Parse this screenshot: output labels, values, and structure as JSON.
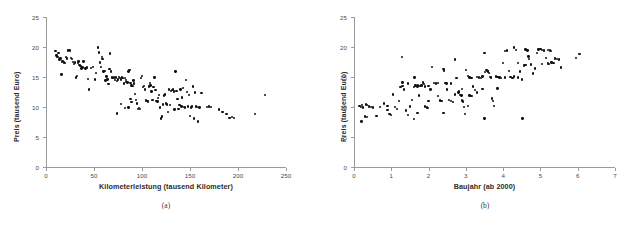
{
  "figure": {
    "background": "#ffffff",
    "point_color": "#111111",
    "axis_color": "#9a9a9a"
  },
  "panels": [
    {
      "caption": "(a)",
      "ylabel": "Preis (tausend Euro)",
      "xlabel": "Kilometerleistung (tausend Kilometer)",
      "xticks": [
        "0",
        "50",
        "100",
        "150",
        "200",
        "250"
      ],
      "yticks": [
        "0",
        "5",
        "10",
        "15",
        "20",
        "25"
      ]
    },
    {
      "caption": "(b)",
      "ylabel": "Preis (tausend Euro)",
      "xlabel": "Baujahr (ab 2000)",
      "xticks": [
        "0",
        "1",
        "2",
        "3",
        "4",
        "5",
        "6",
        "7"
      ],
      "yticks": [
        "0",
        "5",
        "10",
        "15",
        "20",
        "25"
      ]
    }
  ],
  "chart_data": [
    {
      "type": "scatter",
      "title": "",
      "subtitle": "(a)",
      "xlabel": "Kilometerleistung (tausend Kilometer)",
      "ylabel": "Preis (tausend Euro)",
      "xlim": [
        0,
        250
      ],
      "ylim": [
        0,
        25
      ],
      "xticks": [
        0,
        50,
        100,
        150,
        200,
        250
      ],
      "yticks": [
        0,
        5,
        10,
        15,
        20,
        25
      ],
      "grid": false,
      "legend": null,
      "n_points": 160,
      "points": [
        [
          10,
          19.3
        ],
        [
          11,
          18.6
        ],
        [
          12,
          18.3
        ],
        [
          13,
          19.0
        ],
        [
          14,
          17.9
        ],
        [
          15,
          18.1
        ],
        [
          16,
          15.4
        ],
        [
          17,
          17.6
        ],
        [
          18,
          17.7
        ],
        [
          19,
          17.4
        ],
        [
          20,
          17.3
        ],
        [
          21,
          18.3
        ],
        [
          22,
          18.1
        ],
        [
          23,
          19.4
        ],
        [
          24,
          19.5
        ],
        [
          25,
          19.4
        ],
        [
          26,
          18.2
        ],
        [
          27,
          18.0
        ],
        [
          28,
          17.5
        ],
        [
          29,
          17.2
        ],
        [
          30,
          17.4
        ],
        [
          31,
          14.9
        ],
        [
          32,
          15.2
        ],
        [
          33,
          17.3
        ],
        [
          34,
          17.6
        ],
        [
          35,
          17.0
        ],
        [
          36,
          16.8
        ],
        [
          37,
          16.4
        ],
        [
          38,
          16.6
        ],
        [
          39,
          17.6
        ],
        [
          41,
          16.4
        ],
        [
          42,
          16.5
        ],
        [
          43,
          16.6
        ],
        [
          44,
          14.7
        ],
        [
          45,
          12.9
        ],
        [
          47,
          16.5
        ],
        [
          49,
          16.7
        ],
        [
          51,
          14.6
        ],
        [
          52,
          15.7
        ],
        [
          54,
          19.9
        ],
        [
          55,
          19.1
        ],
        [
          56,
          17.4
        ],
        [
          57,
          16.7
        ],
        [
          58,
          18.3
        ],
        [
          59,
          18.0
        ],
        [
          60,
          15.9
        ],
        [
          61,
          16.0
        ],
        [
          62,
          14.4
        ],
        [
          63,
          15.1
        ],
        [
          64,
          14.6
        ],
        [
          65,
          13.8
        ],
        [
          66,
          16.3
        ],
        [
          67,
          18.9
        ],
        [
          68,
          15.9
        ],
        [
          69,
          14.9
        ],
        [
          70,
          14.8
        ],
        [
          71,
          14.9
        ],
        [
          72,
          14.5
        ],
        [
          73,
          14.9
        ],
        [
          74,
          14.3
        ],
        [
          75,
          14.6
        ],
        [
          76,
          15.0
        ],
        [
          77,
          14.8
        ],
        [
          78,
          14.6
        ],
        [
          79,
          14.9
        ],
        [
          80,
          14.8
        ],
        [
          81,
          13.9
        ],
        [
          82,
          14.8
        ],
        [
          83,
          14.5
        ],
        [
          84,
          14.2
        ],
        [
          85,
          14.1
        ],
        [
          86,
          15.9
        ],
        [
          87,
          16.2
        ],
        [
          88,
          14.0
        ],
        [
          89,
          13.6
        ],
        [
          74,
          8.9
        ],
        [
          78,
          10.5
        ],
        [
          82,
          9.8
        ],
        [
          86,
          9.9
        ],
        [
          88,
          11.3
        ],
        [
          89,
          10.8
        ],
        [
          90,
          13.5
        ],
        [
          91,
          14.4
        ],
        [
          92,
          13.9
        ],
        [
          93,
          12.2
        ],
        [
          94,
          11.2
        ],
        [
          95,
          10.6
        ],
        [
          96,
          9.7
        ],
        [
          97,
          9.8
        ],
        [
          98,
          9.7
        ],
        [
          99,
          14.8
        ],
        [
          100,
          15.2
        ],
        [
          101,
          13.3
        ],
        [
          102,
          13.5
        ],
        [
          103,
          12.9
        ],
        [
          104,
          11.1
        ],
        [
          105,
          11.0
        ],
        [
          106,
          10.9
        ],
        [
          107,
          13.4
        ],
        [
          108,
          14.0
        ],
        [
          109,
          13.6
        ],
        [
          110,
          12.6
        ],
        [
          111,
          11.2
        ],
        [
          112,
          13.3
        ],
        [
          113,
          14.9
        ],
        [
          114,
          12.8
        ],
        [
          115,
          11.0
        ],
        [
          116,
          10.9
        ],
        [
          117,
          11.5
        ],
        [
          118,
          12.0
        ],
        [
          119,
          9.9
        ],
        [
          120,
          8.1
        ],
        [
          121,
          8.4
        ],
        [
          122,
          10.4
        ],
        [
          123,
          11.9
        ],
        [
          124,
          12.1
        ],
        [
          125,
          10.6
        ],
        [
          126,
          10.4
        ],
        [
          127,
          9.2
        ],
        [
          128,
          12.9
        ],
        [
          129,
          10.3
        ],
        [
          130,
          12.7
        ],
        [
          131,
          12.8
        ],
        [
          132,
          12.9
        ],
        [
          133,
          12.6
        ],
        [
          134,
          9.6
        ],
        [
          135,
          15.9
        ],
        [
          136,
          12.7
        ],
        [
          137,
          11.3
        ],
        [
          138,
          9.7
        ],
        [
          139,
          10.3
        ],
        [
          140,
          12.9
        ],
        [
          141,
          10.1
        ],
        [
          142,
          11.6
        ],
        [
          143,
          13.2
        ],
        [
          144,
          10.0
        ],
        [
          145,
          9.9
        ],
        [
          146,
          14.5
        ],
        [
          147,
          12.5
        ],
        [
          148,
          10.1
        ],
        [
          149,
          12.0
        ],
        [
          150,
          8.5
        ],
        [
          151,
          9.9
        ],
        [
          152,
          10.1
        ],
        [
          153,
          13.4
        ],
        [
          154,
          8.1
        ],
        [
          155,
          12.4
        ],
        [
          156,
          10.1
        ],
        [
          157,
          10.0
        ],
        [
          158,
          7.6
        ],
        [
          160,
          9.9
        ],
        [
          162,
          12.3
        ],
        [
          168,
          10.0
        ],
        [
          170,
          10.1
        ],
        [
          172,
          10.0
        ],
        [
          180,
          9.6
        ],
        [
          184,
          9.2
        ],
        [
          188,
          8.8
        ],
        [
          191,
          8.2
        ],
        [
          194,
          8.3
        ],
        [
          196,
          8.2
        ],
        [
          218,
          8.8
        ],
        [
          228,
          12.0
        ]
      ]
    },
    {
      "type": "scatter",
      "title": "",
      "subtitle": "(b)",
      "xlabel": "Baujahr (ab 2000)",
      "ylabel": "Preis (tausend Euro)",
      "xlim": [
        0,
        7
      ],
      "ylim": [
        0,
        25
      ],
      "xticks": [
        0,
        1,
        2,
        3,
        4,
        5,
        6,
        7
      ],
      "yticks": [
        0,
        5,
        10,
        15,
        20,
        25
      ],
      "grid": false,
      "legend": null,
      "n_points": 160,
      "points": [
        [
          0.15,
          10.2
        ],
        [
          0.18,
          10.0
        ],
        [
          0.2,
          7.6
        ],
        [
          0.22,
          10.3
        ],
        [
          0.25,
          9.9
        ],
        [
          0.3,
          8.4
        ],
        [
          0.33,
          10.4
        ],
        [
          0.35,
          10.3
        ],
        [
          0.4,
          10.1
        ],
        [
          0.45,
          10.0
        ],
        [
          0.5,
          9.9
        ],
        [
          0.6,
          8.5
        ],
        [
          0.7,
          10.0
        ],
        [
          0.8,
          10.6
        ],
        [
          0.9,
          9.5
        ],
        [
          0.95,
          8.8
        ],
        [
          1.0,
          8.7
        ],
        [
          1.05,
          12.1
        ],
        [
          1.1,
          10.0
        ],
        [
          1.15,
          9.7
        ],
        [
          1.2,
          11.0
        ],
        [
          1.25,
          13.3
        ],
        [
          1.28,
          18.3
        ],
        [
          1.3,
          13.5
        ],
        [
          1.35,
          12.9
        ],
        [
          1.4,
          9.4
        ],
        [
          1.45,
          8.7
        ],
        [
          1.5,
          10.1
        ],
        [
          1.55,
          11.2
        ],
        [
          1.6,
          13.3
        ],
        [
          1.62,
          14.9
        ],
        [
          1.65,
          13.6
        ],
        [
          1.68,
          13.5
        ],
        [
          1.7,
          13.4
        ],
        [
          1.72,
          13.6
        ],
        [
          1.75,
          11.9
        ],
        [
          1.78,
          13.5
        ],
        [
          1.8,
          13.7
        ],
        [
          1.82,
          13.6
        ],
        [
          1.85,
          14.1
        ],
        [
          1.88,
          13.8
        ],
        [
          1.9,
          10.1
        ],
        [
          1.95,
          9.9
        ],
        [
          1.6,
          8.0
        ],
        [
          1.98,
          9.8
        ],
        [
          2.0,
          13.5
        ],
        [
          2.05,
          12.9
        ],
        [
          2.1,
          16.7
        ],
        [
          2.15,
          14.0
        ],
        [
          2.2,
          13.9
        ],
        [
          2.25,
          11.8
        ],
        [
          2.3,
          11.1
        ],
        [
          2.35,
          11.0
        ],
        [
          2.4,
          16.3
        ],
        [
          2.42,
          16.1
        ],
        [
          2.45,
          14.0
        ],
        [
          2.48,
          13.9
        ],
        [
          2.5,
          12.9
        ],
        [
          2.55,
          11.2
        ],
        [
          2.6,
          11.0
        ],
        [
          2.65,
          10.8
        ],
        [
          2.7,
          17.9
        ],
        [
          2.75,
          14.8
        ],
        [
          2.8,
          12.4
        ],
        [
          2.82,
          12.6
        ],
        [
          2.85,
          12.0
        ],
        [
          2.88,
          11.9
        ],
        [
          2.9,
          11.1
        ],
        [
          2.92,
          10.9
        ],
        [
          2.95,
          10.0
        ],
        [
          2.98,
          8.8
        ],
        [
          3.0,
          16.2
        ],
        [
          3.05,
          15.2
        ],
        [
          3.1,
          14.9
        ],
        [
          3.15,
          14.8
        ],
        [
          3.2,
          13.4
        ],
        [
          3.25,
          12.8
        ],
        [
          3.3,
          15.0
        ],
        [
          3.35,
          14.9
        ],
        [
          3.4,
          14.8
        ],
        [
          3.45,
          15.1
        ],
        [
          3.5,
          19.0
        ],
        [
          3.52,
          15.8
        ],
        [
          3.55,
          16.2
        ],
        [
          3.58,
          16.0
        ],
        [
          3.6,
          15.9
        ],
        [
          3.62,
          15.7
        ],
        [
          3.65,
          15.0
        ],
        [
          3.68,
          14.9
        ],
        [
          3.7,
          11.4
        ],
        [
          3.72,
          11.0
        ],
        [
          3.75,
          10.2
        ],
        [
          3.5,
          8.1
        ],
        [
          3.8,
          15.1
        ],
        [
          3.85,
          13.1
        ],
        [
          3.9,
          14.9
        ],
        [
          3.95,
          14.8
        ],
        [
          4.0,
          17.3
        ],
        [
          4.05,
          19.3
        ],
        [
          4.1,
          19.4
        ],
        [
          4.15,
          16.0
        ],
        [
          4.2,
          15.0
        ],
        [
          4.25,
          14.8
        ],
        [
          4.3,
          19.9
        ],
        [
          4.35,
          19.5
        ],
        [
          4.4,
          17.3
        ],
        [
          4.45,
          15.9
        ],
        [
          4.5,
          14.6
        ],
        [
          4.52,
          8.1
        ],
        [
          4.55,
          16.9
        ],
        [
          4.6,
          19.6
        ],
        [
          4.62,
          19.5
        ],
        [
          4.65,
          19.4
        ],
        [
          4.68,
          18.4
        ],
        [
          4.7,
          18.0
        ],
        [
          4.75,
          17.1
        ],
        [
          4.8,
          15.6
        ],
        [
          4.85,
          16.4
        ],
        [
          4.9,
          19.0
        ],
        [
          4.95,
          19.6
        ],
        [
          5.0,
          19.7
        ],
        [
          5.05,
          19.5
        ],
        [
          5.1,
          19.4
        ],
        [
          5.15,
          18.2
        ],
        [
          5.2,
          17.3
        ],
        [
          5.22,
          17.2
        ],
        [
          5.25,
          19.4
        ],
        [
          5.28,
          19.3
        ],
        [
          5.3,
          17.4
        ],
        [
          5.35,
          17.3
        ],
        [
          5.4,
          18.1
        ],
        [
          5.45,
          18.0
        ],
        [
          5.5,
          17.9
        ],
        [
          5.55,
          16.6
        ],
        [
          5.95,
          18.2
        ],
        [
          6.05,
          18.8
        ],
        [
          1.3,
          14.1
        ],
        [
          2.25,
          14.0
        ],
        [
          3.1,
          11.9
        ],
        [
          3.15,
          11.8
        ],
        [
          4.05,
          14.9
        ],
        [
          0.35,
          8.3
        ],
        [
          2.9,
          13.0
        ],
        [
          1.45,
          13.9
        ],
        [
          2.6,
          13.9
        ],
        [
          3.3,
          12.4
        ],
        [
          4.4,
          14.9
        ],
        [
          5.05,
          17.2
        ],
        [
          2.0,
          11.0
        ],
        [
          3.45,
          13.0
        ],
        [
          1.9,
          13.4
        ],
        [
          2.7,
          12.1
        ],
        [
          3.85,
          15.0
        ],
        [
          4.3,
          15.1
        ],
        [
          5.2,
          19.5
        ],
        [
          0.9,
          10.2
        ],
        [
          1.7,
          9.0
        ],
        [
          2.4,
          9.0
        ],
        [
          3.05,
          10.2
        ],
        [
          4.6,
          17.0
        ]
      ]
    }
  ]
}
